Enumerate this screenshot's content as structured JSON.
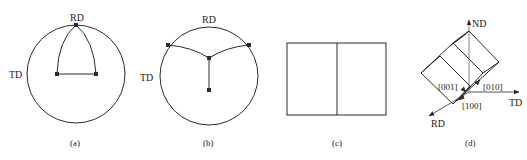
{
  "panels": {
    "a": {
      "caption": "(a)",
      "labels": {
        "top": "RD",
        "left": "TD"
      }
    },
    "b": {
      "caption": "(b)",
      "labels": {
        "top": "RD",
        "left": "TD"
      }
    },
    "c": {
      "caption": "(c)"
    },
    "d": {
      "caption": "(d)",
      "axes": {
        "vertical": "ND",
        "horizontal": "TD",
        "diagonal": "RD"
      },
      "directions": [
        "[001]",
        "[010]",
        "[100]"
      ]
    }
  },
  "colors": {
    "stroke": "#2a2a2a",
    "text": "#222222",
    "background": "#ffffff"
  }
}
